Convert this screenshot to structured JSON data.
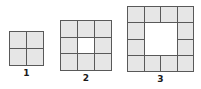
{
  "background_color": "#ffffff",
  "colors": {
    "cell_fill": "#e6e6e6",
    "hole_fill": "#ffffff",
    "grid_line": "#595959",
    "label_text": "#1a1a1a"
  },
  "chart_data": {
    "type": "diagram",
    "title": "",
    "figures": [
      {
        "label": "1",
        "grid_size": 2,
        "total_cells": 4,
        "shaded_cells": 4,
        "hole_size": 0,
        "hole_cells": 0,
        "cells": [
          [
            "shaded",
            "shaded"
          ],
          [
            "shaded",
            "shaded"
          ]
        ]
      },
      {
        "label": "2",
        "grid_size": 3,
        "total_cells": 9,
        "shaded_cells": 8,
        "hole_size": 1,
        "hole_cells": 1,
        "cells": [
          [
            "shaded",
            "shaded",
            "shaded"
          ],
          [
            "shaded",
            "hole",
            "shaded"
          ],
          [
            "shaded",
            "shaded",
            "shaded"
          ]
        ]
      },
      {
        "label": "3",
        "grid_size": 4,
        "total_cells": 16,
        "shaded_cells": 12,
        "hole_size": 2,
        "hole_cells": 4,
        "cells": [
          [
            "shaded",
            "shaded",
            "shaded",
            "shaded"
          ],
          [
            "shaded",
            "hole",
            "hole",
            "shaded"
          ],
          [
            "shaded",
            "hole",
            "hole",
            "shaded"
          ],
          [
            "shaded",
            "shaded",
            "shaded",
            "shaded"
          ]
        ]
      }
    ],
    "shaded_sequence": [
      4,
      8,
      12
    ],
    "labels": [
      "1",
      "2",
      "3"
    ]
  }
}
